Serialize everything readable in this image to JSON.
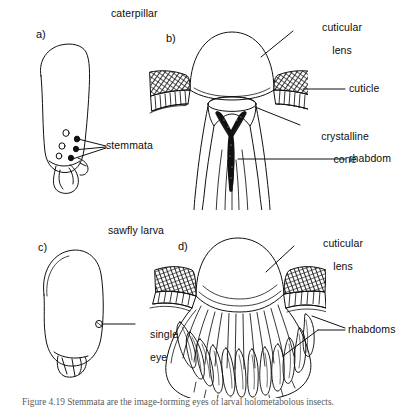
{
  "figure": {
    "title_top_left_group": "caterpillar",
    "title_bottom_left_group": "sawfly larva",
    "caption": "Figure 4.19 a-d"
  },
  "panels": [
    {
      "letter": "a)",
      "name": "caterpillar-head",
      "group_label": "caterpillar",
      "labels": [
        {
          "name": "stemmata",
          "text": "stemmata"
        }
      ]
    },
    {
      "letter": "b)",
      "name": "caterpillar-stemma-section",
      "labels": [
        {
          "name": "cuticular-lens",
          "text": "cuticular\nlens"
        },
        {
          "name": "cuticle",
          "text": "cuticle"
        },
        {
          "name": "crystalline-cone",
          "text": "crystalline\ncone"
        },
        {
          "name": "rhabdom",
          "text": "rhabdom"
        }
      ]
    },
    {
      "letter": "c)",
      "name": "sawfly-larva-head",
      "group_label": "sawfly larva",
      "labels": [
        {
          "name": "single-eye",
          "text": "single\neye"
        }
      ]
    },
    {
      "letter": "d)",
      "name": "sawfly-larva-eye-section",
      "labels": [
        {
          "name": "cuticular-lens",
          "text": "cuticular\nlens"
        },
        {
          "name": "rhabdoms",
          "text": "rhabdoms"
        }
      ]
    }
  ],
  "labels": {
    "panel_a_letter": "a)",
    "panel_b_letter": "b)",
    "panel_c_letter": "c)",
    "panel_d_letter": "d)",
    "caterpillar": "caterpillar",
    "sawfly_larva": "sawfly larva",
    "stemmata": "stemmata",
    "cuticular_lens_b_line1": "cuticular",
    "cuticular_lens_b_line2": "lens",
    "cuticle": "cuticle",
    "crystalline_cone_line1": "crystalline",
    "crystalline_cone_line2": "cone",
    "rhabdom": "rhabdom",
    "single_eye_line1": "single",
    "single_eye_line2": "eye",
    "cuticular_lens_d_line1": "cuticular",
    "cuticular_lens_d_line2": "lens",
    "rhabdoms": "rhabdoms",
    "caption": "Figure 4.19  Stemmata are the image-forming eyes of larval holometabolous insects."
  },
  "colors": {
    "ink": "#111111",
    "paper": "#ffffff",
    "hatch": "#2a2a2a",
    "caption": "#5a5a5a"
  }
}
